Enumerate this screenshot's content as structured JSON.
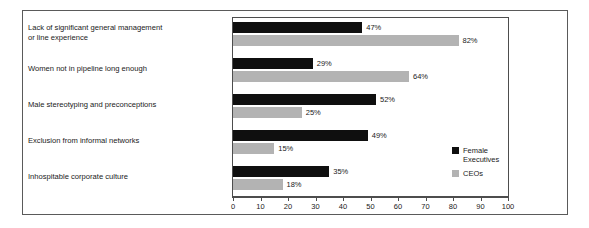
{
  "chart_data": {
    "type": "bar",
    "orientation": "horizontal",
    "title": "",
    "subtitle": "",
    "xlabel": "",
    "ylabel": "",
    "xlim": [
      0,
      100
    ],
    "xticks": [
      0,
      10,
      20,
      30,
      40,
      50,
      60,
      70,
      80,
      90,
      100
    ],
    "xtick_labels": [
      "0",
      "10",
      "20",
      "30",
      "40",
      "50",
      "60",
      "70",
      "80",
      "90",
      "100"
    ],
    "grid": false,
    "legend_position": "inside-right-lower",
    "categories": [
      "Lack of significant general management\nor line experience",
      "Women not in pipeline long enough",
      "Male stereotyping and preconceptions",
      "Exclusion from informal networks",
      "Inhospitable corporate culture"
    ],
    "series": [
      {
        "name": "Female\nExecutives",
        "legend_label": "Female\nExecutives",
        "color": "#0f0f0f",
        "values": [
          47,
          29,
          52,
          49,
          35
        ],
        "value_labels": [
          "47%",
          "29%",
          "52%",
          "49%",
          "35%"
        ]
      },
      {
        "name": "CEOs",
        "legend_label": "CEOs",
        "color": "#b3b3b3",
        "values": [
          82,
          64,
          25,
          15,
          18
        ],
        "value_labels": [
          "82%",
          "64%",
          "25%",
          "15%",
          "18%"
        ]
      }
    ]
  }
}
